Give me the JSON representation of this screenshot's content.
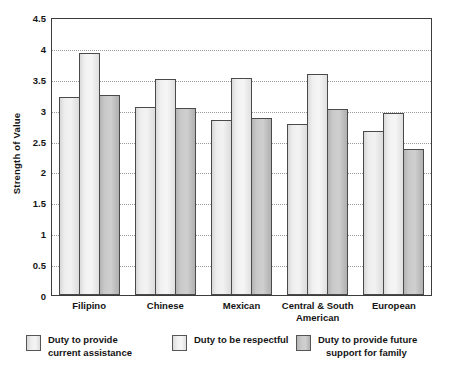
{
  "chart_data": {
    "type": "bar",
    "title": "",
    "xlabel": "",
    "ylabel": "Strength of Value",
    "ylim": [
      0,
      4.5
    ],
    "yticks": [
      "4.5",
      "4",
      "3.5",
      "3",
      "2.5",
      "2",
      "1.5",
      "1",
      "0.5",
      "0"
    ],
    "ytick_values": [
      4.5,
      4,
      3.5,
      3,
      2.5,
      2,
      1.5,
      1,
      0.5,
      0
    ],
    "grid": "horizontal-dotted",
    "legend_position": "bottom",
    "categories": [
      "Filipino",
      "Chinese",
      "Mexican",
      "Central & South American",
      "European"
    ],
    "series": [
      {
        "name": "Duty to provide current assistance",
        "color": "#eeeeee",
        "values": [
          3.21,
          3.05,
          2.84,
          2.77,
          2.66
        ]
      },
      {
        "name": "Duty to be respectful",
        "color": "#f2f2f2",
        "values": [
          3.92,
          3.5,
          3.52,
          3.57,
          2.95
        ]
      },
      {
        "name": "Duty to provide future support for family",
        "color": "#c6c6c6",
        "values": [
          3.24,
          3.02,
          2.86,
          3.01,
          2.37
        ]
      }
    ]
  },
  "axis": {
    "y_title": "Strength of Value"
  },
  "legend": {
    "items": [
      {
        "label_line1": "Duty to provide",
        "label_line2": "current assistance",
        "swatch": "series-1-swatch"
      },
      {
        "label_line1": "Duty to be respectful",
        "label_line2": "",
        "swatch": "series-2-swatch"
      },
      {
        "label_line1": "Duty to provide future",
        "label_line2": "support for family",
        "swatch": "series-3-swatch"
      }
    ]
  },
  "xlabels": [
    {
      "line1": "Filipino",
      "line2": ""
    },
    {
      "line1": "Chinese",
      "line2": ""
    },
    {
      "line1": "Mexican",
      "line2": ""
    },
    {
      "line1": "Central & South",
      "line2": "American"
    },
    {
      "line1": "European",
      "line2": ""
    }
  ]
}
